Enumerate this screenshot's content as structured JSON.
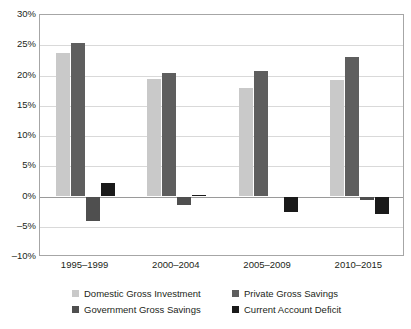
{
  "chart_data": {
    "type": "bar",
    "title": "",
    "subtitle": "",
    "xlabel": "",
    "ylabel": "",
    "categories": [
      "1995–1999",
      "2000–2004",
      "2005–2009",
      "2010–2015"
    ],
    "series": [
      {
        "name": "Domestic Gross Investment",
        "color": "#c9c9c9",
        "values": [
          23.8,
          19.4,
          18.0,
          19.3
        ]
      },
      {
        "name": "Private Gross Savings",
        "color": "#5e5e5e",
        "values": [
          25.4,
          20.4,
          20.7,
          23.0
        ]
      },
      {
        "name": "Government Gross Savings",
        "color": "#4f4f4f",
        "values": [
          -4.0,
          -1.4,
          0.0,
          -0.5
        ]
      },
      {
        "name": "Current Account Deficit",
        "color": "#1a1a1a",
        "values": [
          2.3,
          0.3,
          -2.5,
          -2.9
        ]
      }
    ],
    "ylim": [
      -10,
      30
    ],
    "ytick_labels": [
      "30%",
      "25%",
      "20%",
      "15%",
      "10%",
      "5%",
      "0%",
      "–5%",
      "–10%"
    ],
    "ytick_values": [
      30,
      25,
      20,
      15,
      10,
      5,
      0,
      -5,
      -10
    ],
    "grid": true,
    "legend_position": "bottom",
    "legend_columns": 2
  },
  "legend": {
    "rows": [
      [
        "Domestic Gross Investment",
        "Private Gross Savings"
      ],
      [
        "Government Gross Savings",
        "Current Account Deficit"
      ]
    ]
  }
}
